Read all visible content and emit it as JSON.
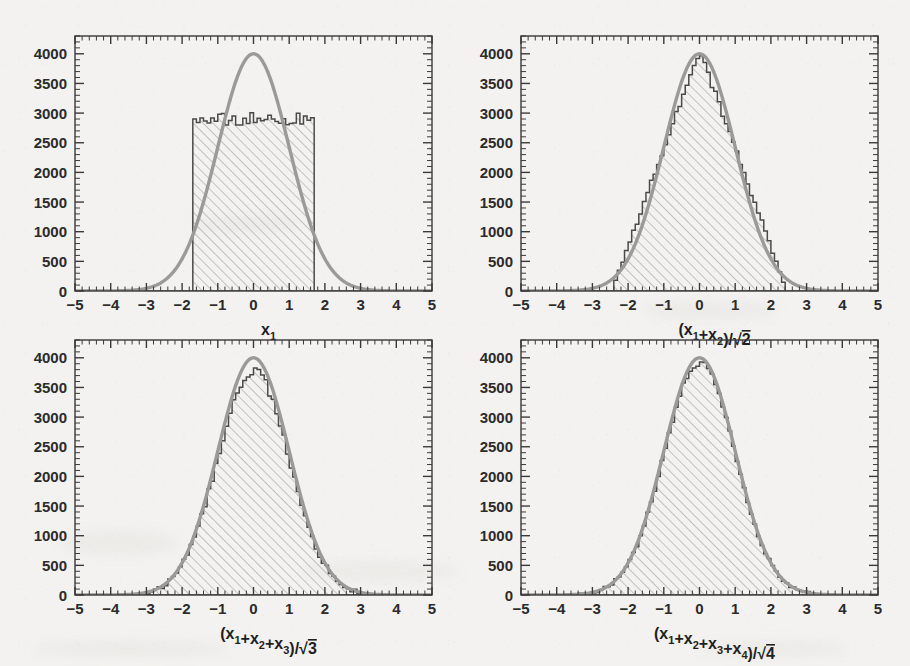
{
  "figure": {
    "background_color": "#f3f2f0",
    "axis_color": "#3a3a3a",
    "hist_line_color": "#4a4a4a",
    "hatch_color": "#b8b8b8",
    "curve_color": "#9a9a9a",
    "panel_count": 4
  },
  "chart_data": [
    {
      "type": "bar",
      "panel": "top-left",
      "title": "",
      "xlabel": "x_1",
      "xlabel_parts": {
        "prefix": "x",
        "sub": "1",
        "suffix": ""
      },
      "ylabel": "",
      "xlim": [
        -5,
        5
      ],
      "ylim": [
        0,
        4300
      ],
      "xticks": [
        -5,
        -4,
        -3,
        -2,
        -1,
        0,
        1,
        2,
        3,
        4,
        5
      ],
      "yticks": [
        0,
        500,
        1000,
        1500,
        2000,
        2500,
        3000,
        3500,
        4000
      ],
      "grid": false,
      "legend": "none",
      "minor_ticks": true,
      "distribution": "uniform",
      "hist_support": [
        -1.732,
        1.732
      ],
      "hist_plateau": 2900,
      "hist_nbins": 100,
      "hist_noise_amplitude": 110,
      "overlay_curve": {
        "name": "gaussian",
        "mean": 0.0,
        "sigma": 1.0,
        "peak": 4000
      },
      "notes": "Flat-topped uniform histogram from -sqrt(3) to +sqrt(3) at ~2900 counts, with Gaussian reference curve peaking at 4000."
    },
    {
      "type": "bar",
      "panel": "top-right",
      "title": "",
      "xlabel": "(x_1+x_2)/sqrt(2)",
      "xlabel_parts": {
        "terms": [
          "x1",
          "x2"
        ],
        "root": "2"
      },
      "ylabel": "",
      "xlim": [
        -5,
        5
      ],
      "ylim": [
        0,
        4300
      ],
      "xticks": [
        -5,
        -4,
        -3,
        -2,
        -1,
        0,
        1,
        2,
        3,
        4,
        5
      ],
      "yticks": [
        0,
        500,
        1000,
        1500,
        2000,
        2500,
        3000,
        3500,
        4000
      ],
      "grid": false,
      "legend": "none",
      "minor_ticks": true,
      "distribution": "triangular",
      "hist_support": [
        -2.449,
        2.449
      ],
      "hist_peak": 4060,
      "hist_nbins": 100,
      "hist_noise_amplitude": 60,
      "overlay_curve": {
        "name": "gaussian",
        "mean": 0.0,
        "sigma": 1.0,
        "peak": 4000
      },
      "notes": "Sum of 2 uniforms scaled by 1/sqrt(2): triangular shape peaking ~4060, compared with unit Gaussian."
    },
    {
      "type": "bar",
      "panel": "bottom-left",
      "title": "",
      "xlabel": "(x_1+x_2+x_3)/sqrt(3)",
      "xlabel_parts": {
        "terms": [
          "x1",
          "x2",
          "x3"
        ],
        "root": "3"
      },
      "ylabel": "",
      "xlim": [
        -5,
        5
      ],
      "ylim": [
        0,
        4300
      ],
      "xticks": [
        -5,
        -4,
        -3,
        -2,
        -1,
        0,
        1,
        2,
        3,
        4,
        5
      ],
      "yticks": [
        0,
        500,
        1000,
        1500,
        2000,
        2500,
        3000,
        3500,
        4000
      ],
      "grid": false,
      "legend": "none",
      "minor_ticks": true,
      "distribution": "irwin-hall-3",
      "hist_support": [
        -3.0,
        3.0
      ],
      "hist_peak": 3780,
      "hist_nbins": 100,
      "hist_noise_amplitude": 75,
      "overlay_curve": {
        "name": "gaussian",
        "mean": 0.0,
        "sigma": 1.0,
        "peak": 4000
      },
      "notes": "Sum of 3 uniforms scaled by 1/sqrt(3): nearly Gaussian, peak ~3780 vs curve 4000."
    },
    {
      "type": "bar",
      "panel": "bottom-right",
      "title": "",
      "xlabel": "(x_1+x_2+x_3+x_4)/sqrt(4)",
      "xlabel_parts": {
        "terms": [
          "x1",
          "x2",
          "x3",
          "x4"
        ],
        "root": "4"
      },
      "ylabel": "",
      "xlim": [
        -5,
        5
      ],
      "ylim": [
        0,
        4300
      ],
      "xticks": [
        -5,
        -4,
        -3,
        -2,
        -1,
        0,
        1,
        2,
        3,
        4,
        5
      ],
      "yticks": [
        0,
        500,
        1000,
        1500,
        2000,
        2500,
        3000,
        3500,
        4000
      ],
      "grid": false,
      "legend": "none",
      "minor_ticks": true,
      "distribution": "irwin-hall-4",
      "hist_support": [
        -3.464,
        3.464
      ],
      "hist_peak": 3910,
      "hist_nbins": 100,
      "hist_noise_amplitude": 55,
      "overlay_curve": {
        "name": "gaussian",
        "mean": 0.0,
        "sigma": 1.0,
        "peak": 4000
      },
      "notes": "Sum of 4 uniforms scaled by 1/2: essentially Gaussian, peak ~3910 vs curve 4000."
    }
  ],
  "axis_tick_labels": {
    "x": [
      "-5",
      "-4",
      "-3",
      "-2",
      "-1",
      "0",
      "1",
      "2",
      "3",
      "4",
      "5"
    ],
    "y": [
      "0",
      "500",
      "1000",
      "1500",
      "2000",
      "2500",
      "3000",
      "3500",
      "4000"
    ]
  }
}
